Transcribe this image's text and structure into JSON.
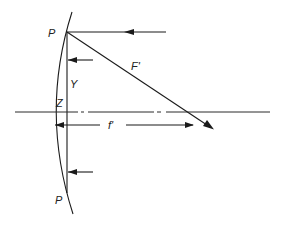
{
  "diagram": {
    "labels": {
      "p_top": "P",
      "p_bottom": "P",
      "y": "Y",
      "z": "Z",
      "f_prime_upper": "F'",
      "f_prime_lower": "f'"
    },
    "elements": {
      "mirror": "curved mirror surface",
      "vertical_chord": "line P–P",
      "optical_axis": "dash-dot optical axis",
      "incident_ray": "horizontal incoming ray at P",
      "reflected_ray": "reflected ray from P toward focal region",
      "focal_length_dimension": "f' dimension along axis",
      "small_arrows": [
        "upper arrow toward chord",
        "lower arrow toward chord",
        "lower-axis arrow toward vertex"
      ]
    },
    "colors": {
      "line": "#1a1a1a",
      "text": "#222222",
      "background": "#ffffff"
    }
  }
}
